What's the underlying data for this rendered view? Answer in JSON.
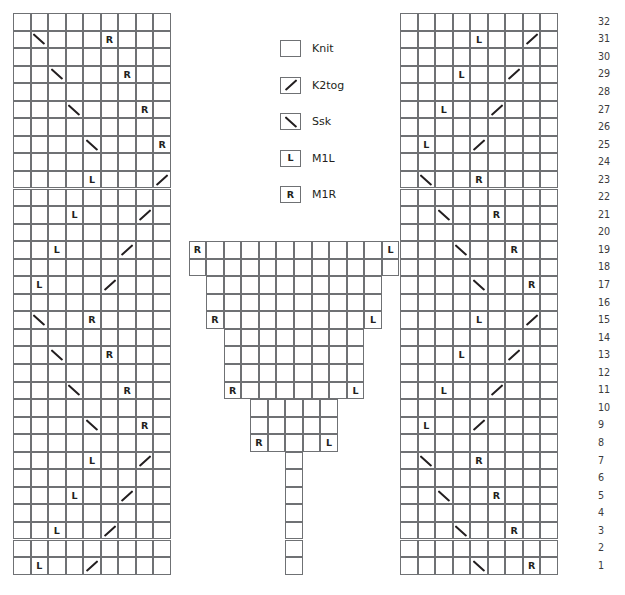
{
  "chart": {
    "total_rows": 32,
    "row_numbers": [
      32,
      31,
      30,
      29,
      28,
      27,
      26,
      25,
      24,
      23,
      22,
      21,
      20,
      19,
      18,
      17,
      16,
      15,
      14,
      13,
      12,
      11,
      10,
      9,
      8,
      7,
      6,
      5,
      4,
      3,
      2,
      1
    ],
    "symbols": {
      "knit": "",
      "k2tog": "/",
      "ssk": "\\",
      "m1l": "L",
      "m1r": "R"
    },
    "colors": {
      "grid_line": "#6f7174",
      "cell_fill": "#ffffff",
      "symbol": "#231f20",
      "row_number": "#3b3b3d"
    }
  },
  "legend": {
    "items": [
      {
        "symbol": "knit",
        "glyph": "",
        "label": "Knit"
      },
      {
        "symbol": "k2tog",
        "glyph": "/",
        "label": "K2tog"
      },
      {
        "symbol": "ssk",
        "glyph": "\\",
        "label": "Ssk"
      },
      {
        "symbol": "m1l",
        "glyph": "L",
        "label": "M1L"
      },
      {
        "symbol": "m1r",
        "glyph": "R",
        "label": "M1R"
      }
    ]
  },
  "panels": {
    "left": {
      "name": "left-panel",
      "columns": 9,
      "rows_from_top": [
        {
          "row": 32,
          "cells": [
            "",
            "",
            "",
            "",
            "",
            "",
            "",
            "",
            ""
          ]
        },
        {
          "row": 31,
          "cells": [
            "",
            "ssk",
            "",
            "",
            "",
            "m1r",
            "",
            "",
            ""
          ]
        },
        {
          "row": 30,
          "cells": [
            "",
            "",
            "",
            "",
            "",
            "",
            "",
            "",
            ""
          ]
        },
        {
          "row": 29,
          "cells": [
            "",
            "",
            "ssk",
            "",
            "",
            "",
            "m1r",
            "",
            ""
          ]
        },
        {
          "row": 28,
          "cells": [
            "",
            "",
            "",
            "",
            "",
            "",
            "",
            "",
            ""
          ]
        },
        {
          "row": 27,
          "cells": [
            "",
            "",
            "",
            "ssk",
            "",
            "",
            "",
            "m1r",
            ""
          ]
        },
        {
          "row": 26,
          "cells": [
            "",
            "",
            "",
            "",
            "",
            "",
            "",
            "",
            ""
          ]
        },
        {
          "row": 25,
          "cells": [
            "",
            "",
            "",
            "",
            "ssk",
            "",
            "",
            "",
            "m1r"
          ]
        },
        {
          "row": 24,
          "cells": [
            "",
            "",
            "",
            "",
            "",
            "",
            "",
            "",
            ""
          ]
        },
        {
          "row": 23,
          "cells": [
            "",
            "",
            "",
            "",
            "m1l",
            "",
            "",
            "",
            "k2tog"
          ]
        },
        {
          "row": 22,
          "cells": [
            "",
            "",
            "",
            "",
            "",
            "",
            "",
            "",
            ""
          ]
        },
        {
          "row": 21,
          "cells": [
            "",
            "",
            "",
            "m1l",
            "",
            "",
            "",
            "k2tog",
            ""
          ]
        },
        {
          "row": 20,
          "cells": [
            "",
            "",
            "",
            "",
            "",
            "",
            "",
            "",
            ""
          ]
        },
        {
          "row": 19,
          "cells": [
            "",
            "",
            "m1l",
            "",
            "",
            "",
            "k2tog",
            "",
            ""
          ]
        },
        {
          "row": 18,
          "cells": [
            "",
            "",
            "",
            "",
            "",
            "",
            "",
            "",
            ""
          ]
        },
        {
          "row": 17,
          "cells": [
            "",
            "m1l",
            "",
            "",
            "",
            "k2tog",
            "",
            "",
            ""
          ]
        },
        {
          "row": 16,
          "cells": [
            "",
            "",
            "",
            "",
            "",
            "",
            "",
            "",
            ""
          ]
        },
        {
          "row": 15,
          "cells": [
            "",
            "ssk",
            "",
            "",
            "m1r",
            "",
            "",
            "",
            ""
          ]
        },
        {
          "row": 14,
          "cells": [
            "",
            "",
            "",
            "",
            "",
            "",
            "",
            "",
            ""
          ]
        },
        {
          "row": 13,
          "cells": [
            "",
            "",
            "ssk",
            "",
            "",
            "m1r",
            "",
            "",
            ""
          ]
        },
        {
          "row": 12,
          "cells": [
            "",
            "",
            "",
            "",
            "",
            "",
            "",
            "",
            ""
          ]
        },
        {
          "row": 11,
          "cells": [
            "",
            "",
            "",
            "ssk",
            "",
            "",
            "m1r",
            "",
            ""
          ]
        },
        {
          "row": 10,
          "cells": [
            "",
            "",
            "",
            "",
            "",
            "",
            "",
            "",
            ""
          ]
        },
        {
          "row": 9,
          "cells": [
            "",
            "",
            "",
            "",
            "ssk",
            "",
            "",
            "m1r",
            ""
          ]
        },
        {
          "row": 8,
          "cells": [
            "",
            "",
            "",
            "",
            "",
            "",
            "",
            "",
            ""
          ]
        },
        {
          "row": 7,
          "cells": [
            "",
            "",
            "",
            "",
            "m1l",
            "",
            "",
            "k2tog",
            ""
          ]
        },
        {
          "row": 6,
          "cells": [
            "",
            "",
            "",
            "",
            "",
            "",
            "",
            "",
            ""
          ]
        },
        {
          "row": 5,
          "cells": [
            "",
            "",
            "",
            "m1l",
            "",
            "",
            "k2tog",
            "",
            ""
          ]
        },
        {
          "row": 4,
          "cells": [
            "",
            "",
            "",
            "",
            "",
            "",
            "",
            "",
            ""
          ]
        },
        {
          "row": 3,
          "cells": [
            "",
            "",
            "m1l",
            "",
            "",
            "k2tog",
            "",
            "",
            ""
          ]
        },
        {
          "row": 2,
          "cells": [
            "",
            "",
            "",
            "",
            "",
            "",
            "",
            "",
            ""
          ]
        },
        {
          "row": 1,
          "cells": [
            "",
            "m1l",
            "",
            "",
            "k2tog",
            "",
            "",
            "",
            ""
          ]
        }
      ]
    },
    "center": {
      "name": "center-panel",
      "note": "stepped pyramid widening toward the top, present only on rows 1-19",
      "rows_from_top": [
        {
          "row": 19,
          "width": 12,
          "cells": [
            "m1r",
            "",
            "",
            "",
            "",
            "",
            "",
            "",
            "",
            "",
            "",
            "m1l"
          ]
        },
        {
          "row": 18,
          "width": 12,
          "cells": [
            "",
            "",
            "",
            "",
            "",
            "",
            "",
            "",
            "",
            "",
            "",
            ""
          ]
        },
        {
          "row": 17,
          "width": 10,
          "cells": [
            "",
            "",
            "",
            "",
            "",
            "",
            "",
            "",
            "",
            ""
          ]
        },
        {
          "row": 16,
          "width": 10,
          "cells": [
            "",
            "",
            "",
            "",
            "",
            "",
            "",
            "",
            "",
            ""
          ]
        },
        {
          "row": 15,
          "width": 10,
          "cells": [
            "m1r",
            "",
            "",
            "",
            "",
            "",
            "",
            "",
            "",
            "m1l"
          ]
        },
        {
          "row": 14,
          "width": 8,
          "cells": [
            "",
            "",
            "",
            "",
            "",
            "",
            "",
            ""
          ]
        },
        {
          "row": 13,
          "width": 8,
          "cells": [
            "",
            "",
            "",
            "",
            "",
            "",
            "",
            ""
          ]
        },
        {
          "row": 12,
          "width": 8,
          "cells": [
            "",
            "",
            "",
            "",
            "",
            "",
            "",
            ""
          ]
        },
        {
          "row": 11,
          "width": 8,
          "cells": [
            "m1r",
            "",
            "",
            "",
            "",
            "",
            "",
            "m1l"
          ]
        },
        {
          "row": 10,
          "width": 5,
          "cells": [
            "",
            "",
            "",
            "",
            ""
          ]
        },
        {
          "row": 9,
          "width": 5,
          "cells": [
            "",
            "",
            "",
            "",
            ""
          ]
        },
        {
          "row": 8,
          "width": 5,
          "cells": [
            "m1r",
            "",
            "",
            "",
            "m1l"
          ]
        },
        {
          "row": 7,
          "width": 1,
          "cells": [
            ""
          ]
        },
        {
          "row": 6,
          "width": 1,
          "cells": [
            ""
          ]
        },
        {
          "row": 5,
          "width": 1,
          "cells": [
            ""
          ]
        },
        {
          "row": 4,
          "width": 1,
          "cells": [
            ""
          ]
        },
        {
          "row": 3,
          "width": 1,
          "cells": [
            ""
          ]
        },
        {
          "row": 2,
          "width": 1,
          "cells": [
            ""
          ]
        },
        {
          "row": 1,
          "width": 1,
          "cells": [
            ""
          ]
        }
      ]
    },
    "right": {
      "name": "right-panel",
      "columns": 9,
      "rows_from_top": [
        {
          "row": 32,
          "cells": [
            "",
            "",
            "",
            "",
            "",
            "",
            "",
            "",
            ""
          ]
        },
        {
          "row": 31,
          "cells": [
            "",
            "",
            "",
            "",
            "m1l",
            "",
            "",
            "k2tog",
            ""
          ]
        },
        {
          "row": 30,
          "cells": [
            "",
            "",
            "",
            "",
            "",
            "",
            "",
            "",
            ""
          ]
        },
        {
          "row": 29,
          "cells": [
            "",
            "",
            "",
            "m1l",
            "",
            "",
            "k2tog",
            "",
            ""
          ]
        },
        {
          "row": 28,
          "cells": [
            "",
            "",
            "",
            "",
            "",
            "",
            "",
            "",
            ""
          ]
        },
        {
          "row": 27,
          "cells": [
            "",
            "",
            "m1l",
            "",
            "",
            "k2tog",
            "",
            "",
            ""
          ]
        },
        {
          "row": 26,
          "cells": [
            "",
            "",
            "",
            "",
            "",
            "",
            "",
            "",
            ""
          ]
        },
        {
          "row": 25,
          "cells": [
            "",
            "m1l",
            "",
            "",
            "k2tog",
            "",
            "",
            "",
            ""
          ]
        },
        {
          "row": 24,
          "cells": [
            "",
            "",
            "",
            "",
            "",
            "",
            "",
            "",
            ""
          ]
        },
        {
          "row": 23,
          "cells": [
            "",
            "ssk",
            "",
            "",
            "m1r",
            "",
            "",
            "",
            ""
          ]
        },
        {
          "row": 22,
          "cells": [
            "",
            "",
            "",
            "",
            "",
            "",
            "",
            "",
            ""
          ]
        },
        {
          "row": 21,
          "cells": [
            "",
            "",
            "ssk",
            "",
            "",
            "m1r",
            "",
            "",
            ""
          ]
        },
        {
          "row": 20,
          "cells": [
            "",
            "",
            "",
            "",
            "",
            "",
            "",
            "",
            ""
          ]
        },
        {
          "row": 19,
          "cells": [
            "",
            "",
            "",
            "ssk",
            "",
            "",
            "m1r",
            "",
            ""
          ]
        },
        {
          "row": 18,
          "cells": [
            "",
            "",
            "",
            "",
            "",
            "",
            "",
            "",
            ""
          ]
        },
        {
          "row": 17,
          "cells": [
            "",
            "",
            "",
            "",
            "ssk",
            "",
            "",
            "m1r",
            ""
          ]
        },
        {
          "row": 16,
          "cells": [
            "",
            "",
            "",
            "",
            "",
            "",
            "",
            "",
            ""
          ]
        },
        {
          "row": 15,
          "cells": [
            "",
            "",
            "",
            "",
            "m1l",
            "",
            "",
            "k2tog",
            ""
          ]
        },
        {
          "row": 14,
          "cells": [
            "",
            "",
            "",
            "",
            "",
            "",
            "",
            "",
            ""
          ]
        },
        {
          "row": 13,
          "cells": [
            "",
            "",
            "",
            "m1l",
            "",
            "",
            "k2tog",
            "",
            ""
          ]
        },
        {
          "row": 12,
          "cells": [
            "",
            "",
            "",
            "",
            "",
            "",
            "",
            "",
            ""
          ]
        },
        {
          "row": 11,
          "cells": [
            "",
            "",
            "m1l",
            "",
            "",
            "k2tog",
            "",
            "",
            ""
          ]
        },
        {
          "row": 10,
          "cells": [
            "",
            "",
            "",
            "",
            "",
            "",
            "",
            "",
            ""
          ]
        },
        {
          "row": 9,
          "cells": [
            "",
            "m1l",
            "",
            "",
            "k2tog",
            "",
            "",
            "",
            ""
          ]
        },
        {
          "row": 8,
          "cells": [
            "",
            "",
            "",
            "",
            "",
            "",
            "",
            "",
            ""
          ]
        },
        {
          "row": 7,
          "cells": [
            "",
            "ssk",
            "",
            "",
            "m1r",
            "",
            "",
            "",
            ""
          ]
        },
        {
          "row": 6,
          "cells": [
            "",
            "",
            "",
            "",
            "",
            "",
            "",
            "",
            ""
          ]
        },
        {
          "row": 5,
          "cells": [
            "",
            "",
            "ssk",
            "",
            "",
            "m1r",
            "",
            "",
            ""
          ]
        },
        {
          "row": 4,
          "cells": [
            "",
            "",
            "",
            "",
            "",
            "",
            "",
            "",
            ""
          ]
        },
        {
          "row": 3,
          "cells": [
            "",
            "",
            "",
            "ssk",
            "",
            "",
            "m1r",
            "",
            ""
          ]
        },
        {
          "row": 2,
          "cells": [
            "",
            "",
            "",
            "",
            "",
            "",
            "",
            "",
            ""
          ]
        },
        {
          "row": 1,
          "cells": [
            "",
            "",
            "",
            "",
            "ssk",
            "",
            "",
            "m1r",
            ""
          ]
        }
      ]
    }
  }
}
